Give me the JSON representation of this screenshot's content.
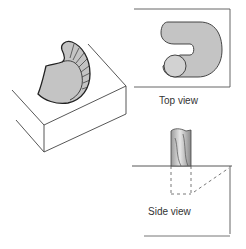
{
  "figure": {
    "type": "machining-illustration",
    "panels": {
      "isometric": {
        "description": "Isometric view of block with curved pocket being machined"
      },
      "top_view": {
        "label": "Top view"
      },
      "side_view": {
        "label": "Side view"
      }
    },
    "colors": {
      "fill": "#c4c4c4",
      "fill_light": "#d6d6d6",
      "outline": "#222222",
      "edge": "#444444",
      "background": "#ffffff"
    }
  }
}
